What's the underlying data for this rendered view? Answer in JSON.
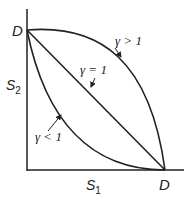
{
  "diagram": {
    "axes": {
      "y_label": "S",
      "y_sub": "2",
      "x_label": "S",
      "x_sub": "1",
      "y_intercept_label": "D",
      "x_intercept_label": "D"
    },
    "curves": [
      {
        "name": "gamma-greater-than-1",
        "label": "γ > 1",
        "shape": "concave"
      },
      {
        "name": "gamma-equal-1",
        "label": "γ = 1",
        "shape": "linear"
      },
      {
        "name": "gamma-less-than-1",
        "label": "γ < 1",
        "shape": "convex"
      }
    ],
    "colors": {
      "stroke": "#222222",
      "background": "#ffffff"
    }
  }
}
